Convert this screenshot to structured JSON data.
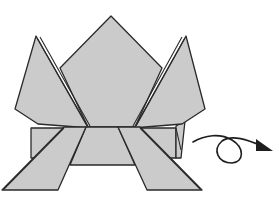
{
  "figure": {
    "type": "origami-diagram",
    "caption": "Origami frog diagram with turn-over arrow",
    "colors": {
      "paper": "#cbcbcb",
      "outline": "#2a2a2a",
      "arrow": "#1e1e1e",
      "background": "#ffffff"
    },
    "parts": [
      {
        "name": "center-point",
        "description": "central diamond point"
      },
      {
        "name": "left-front-leg-flap",
        "description": "upper left pointed flap"
      },
      {
        "name": "right-front-leg-flap",
        "description": "upper right pointed flap"
      },
      {
        "name": "base-band",
        "description": "horizontal folded band"
      },
      {
        "name": "left-back-leg",
        "description": "lower left slanted leg"
      },
      {
        "name": "right-back-leg",
        "description": "lower right slanted leg"
      }
    ],
    "symbol": {
      "name": "turn-over-arrow",
      "meaning": "turn the model over"
    }
  }
}
